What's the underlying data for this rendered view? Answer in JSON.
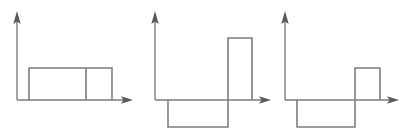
{
  "figure": {
    "title": "",
    "background_color": "#ffffff",
    "stroke_color": "#7d7d7d",
    "arrow_color": "#5a5a5a",
    "panel_count": 3
  },
  "chart_data": {
    "type": "line",
    "title": "",
    "xlabel": "",
    "ylabel": "",
    "grid": false,
    "legend": false,
    "panels": [
      {
        "name": "panel-1",
        "label": "",
        "axis_origin": [
          17,
          100
        ],
        "y_axis_top": 14,
        "x_axis_end": 132,
        "baseline_y": 100,
        "positive_level_y": 68,
        "negative_level_y": 127,
        "segments": [
          {
            "x_start": 29,
            "x_end": 86,
            "level": "positive"
          },
          {
            "x_start": 86,
            "x_end": 112,
            "level": "positive"
          }
        ],
        "dividers": [
          86
        ],
        "x_breakpoints": [
          29,
          86,
          112
        ],
        "values": [
          1,
          1
        ],
        "ylim": [
          -1,
          1
        ]
      },
      {
        "name": "panel-2",
        "label": "",
        "axis_origin": [
          155,
          100
        ],
        "y_axis_top": 14,
        "x_axis_end": 270,
        "baseline_y": 100,
        "positive_level_y": 38,
        "negative_level_y": 127,
        "segments": [
          {
            "x_start": 168,
            "x_end": 228,
            "level": "negative"
          },
          {
            "x_start": 228,
            "x_end": 252,
            "level": "positive"
          }
        ],
        "dividers": [],
        "x_breakpoints": [
          168,
          228,
          252
        ],
        "values": [
          -1,
          2
        ],
        "ylim": [
          -1,
          2
        ]
      },
      {
        "name": "panel-3",
        "label": "",
        "axis_origin": [
          285,
          100
        ],
        "y_axis_top": 14,
        "x_axis_end": 398,
        "baseline_y": 100,
        "positive_level_y": 68,
        "negative_level_y": 127,
        "segments": [
          {
            "x_start": 297,
            "x_end": 355,
            "level": "negative"
          },
          {
            "x_start": 355,
            "x_end": 380,
            "level": "positive"
          }
        ],
        "dividers": [],
        "x_breakpoints": [
          297,
          355,
          380
        ],
        "values": [
          -1,
          1
        ],
        "ylim": [
          -1,
          1
        ]
      }
    ]
  }
}
